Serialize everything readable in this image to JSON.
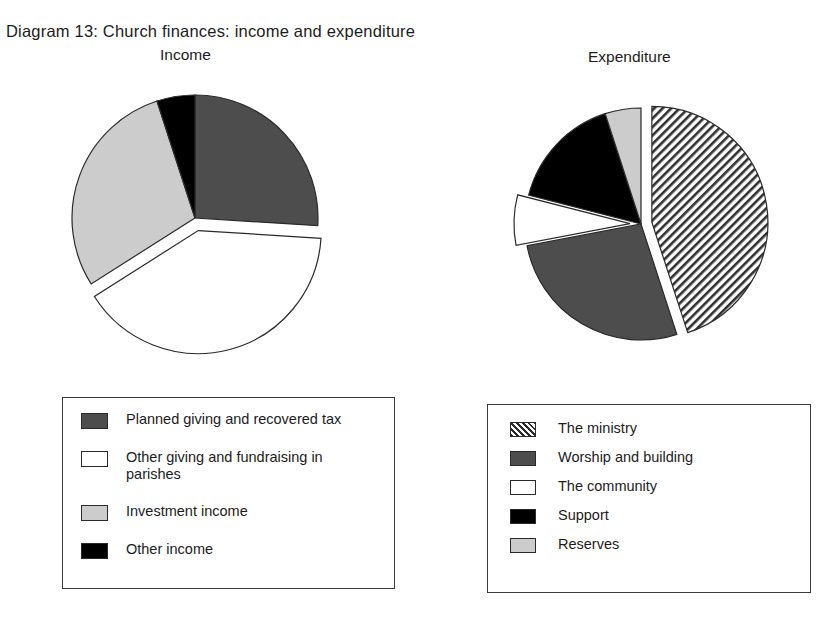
{
  "title": "Diagram 13:  Church finances: income and expenditure",
  "charts": {
    "income": {
      "subtitle": "Income",
      "legend": [
        {
          "label": "Planned giving and recovered tax",
          "swatch": "dark-gray-swatch"
        },
        {
          "label": "Other giving and fundraising in parishes",
          "swatch": "white-swatch"
        },
        {
          "label": "Investment income",
          "swatch": "light-gray-swatch"
        },
        {
          "label": "Other income",
          "swatch": "black-swatch"
        }
      ]
    },
    "expenditure": {
      "subtitle": "Expenditure",
      "legend": [
        {
          "label": "The ministry",
          "swatch": "hatched-swatch"
        },
        {
          "label": "Worship and building",
          "swatch": "dark-gray-swatch"
        },
        {
          "label": "The community",
          "swatch": "white-swatch"
        },
        {
          "label": "Support",
          "swatch": "black-swatch"
        },
        {
          "label": "Reserves",
          "swatch": "light-gray-swatch"
        }
      ]
    }
  },
  "chart_data": [
    {
      "type": "pie",
      "title": "Income",
      "labels": [
        "Planned giving and recovered tax",
        "Other giving and fundraising in parishes",
        "Investment income",
        "Other income"
      ],
      "values": [
        26,
        40,
        29,
        5
      ],
      "colors": [
        "#4d4d4d",
        "#ffffff",
        "#cccccc",
        "#000000"
      ],
      "patterns": [
        "solid",
        "solid",
        "solid",
        "solid"
      ],
      "exploded": [
        false,
        true,
        false,
        false
      ],
      "start_angle": 0,
      "legend_position": "bottom"
    },
    {
      "type": "pie",
      "title": "Expenditure",
      "labels": [
        "The ministry",
        "Worship and building",
        "The community",
        "Support",
        "Reserves"
      ],
      "values": [
        45,
        27,
        7,
        16,
        5
      ],
      "colors": [
        "#ffffff",
        "#4d4d4d",
        "#ffffff",
        "#000000",
        "#cccccc"
      ],
      "patterns": [
        "diagonal-hatch",
        "solid",
        "solid",
        "solid",
        "solid"
      ],
      "exploded": [
        true,
        false,
        true,
        false,
        false
      ],
      "start_angle": 0,
      "legend_position": "bottom"
    }
  ]
}
